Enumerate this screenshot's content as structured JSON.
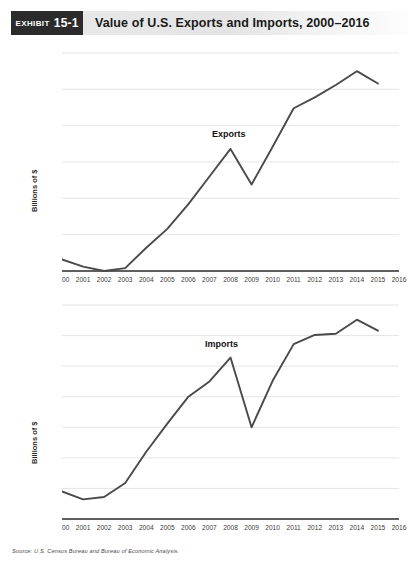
{
  "header": {
    "exhibit_word": "Exhibit",
    "exhibit_number": "15-1",
    "title": "Value of U.S. Exports and Imports, 2000–2016",
    "badge_color": "#2b2b2b",
    "bar_color": "#e7e7e7"
  },
  "source": {
    "text": "Source: U.S. Census Bureau and Bureau of Economic Analysis."
  },
  "line_color": "#4a4a4a",
  "chart_data": [
    {
      "type": "line",
      "name": "exports-chart",
      "title": "",
      "xlabel": "",
      "ylabel": "Billions of $",
      "series_label": "Exports",
      "grid": true,
      "legend_position": "inline-annotation",
      "xlim": [
        2000,
        2016
      ],
      "ylim": [
        1000,
        2500
      ],
      "ytick_step": 250,
      "yticks": [
        1000,
        1250,
        1500,
        1750,
        2000,
        2250,
        2500
      ],
      "categories": [
        2000,
        2001,
        2002,
        2003,
        2004,
        2005,
        2006,
        2007,
        2008,
        2009,
        2010,
        2011,
        2012,
        2013,
        2014,
        2015,
        2016
      ],
      "x": [
        2000,
        2001,
        2002,
        2003,
        2004,
        2005,
        2006,
        2007,
        2008,
        2009,
        2010,
        2011,
        2012,
        2013,
        2014,
        2015
      ],
      "values": [
        1080,
        1030,
        1000,
        1020,
        1160,
        1290,
        1460,
        1650,
        1840,
        1595,
        1855,
        2120,
        2195,
        2280,
        2375,
        2290
      ]
    },
    {
      "type": "line",
      "name": "imports-chart",
      "title": "",
      "xlabel": "",
      "ylabel": "Billions of $",
      "series_label": "Imports",
      "grid": true,
      "legend_position": "inline-annotation",
      "xlim": [
        2000,
        2016
      ],
      "ylim": [
        1250,
        3000
      ],
      "ytick_step": 250,
      "yticks": [
        1250,
        1500,
        1750,
        2000,
        2250,
        2500,
        2750,
        3000
      ],
      "categories": [
        2000,
        2001,
        2002,
        2003,
        2004,
        2005,
        2006,
        2007,
        2008,
        2009,
        2010,
        2011,
        2012,
        2013,
        2014,
        2015,
        2016
      ],
      "x": [
        2000,
        2001,
        2002,
        2003,
        2004,
        2005,
        2006,
        2007,
        2008,
        2009,
        2010,
        2011,
        2012,
        2013,
        2014,
        2015
      ],
      "values": [
        1475,
        1410,
        1430,
        1545,
        1800,
        2030,
        2250,
        2375,
        2570,
        2000,
        2380,
        2680,
        2755,
        2765,
        2880,
        2790
      ]
    }
  ]
}
